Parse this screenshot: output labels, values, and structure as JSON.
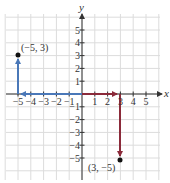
{
  "figure": {
    "type": "coordinate-plane",
    "axes": {
      "x_label": "x",
      "y_label": "y",
      "x_ticks": [
        "-5",
        "-4",
        "-3",
        "-2",
        "-1",
        "1",
        "2",
        "3",
        "4",
        "5"
      ],
      "y_ticks": [
        "5",
        "4",
        "3",
        "2",
        "1",
        "-1",
        "-2",
        "-3",
        "-4",
        "-5"
      ],
      "x_range": [
        -6,
        6
      ],
      "y_range": [
        -6,
        6
      ]
    },
    "points": [
      {
        "label": "(−5, 3)",
        "x": -5,
        "y": 3
      },
      {
        "label": "(3, −5)",
        "x": 3,
        "y": -5
      }
    ],
    "paths": [
      {
        "name": "blue-path",
        "color": "#4a78b8",
        "description": "from origin left to (-5,0), then up to (-5,3)"
      },
      {
        "name": "red-path",
        "color": "#8b2a3a",
        "description": "from origin right to (3,0), then down to (3,-5)"
      }
    ],
    "colors": {
      "grid": "#dcdcdc",
      "axis": "#333333",
      "blue": "#4a78b8",
      "red": "#8b2a3a",
      "point": "#111111"
    }
  }
}
